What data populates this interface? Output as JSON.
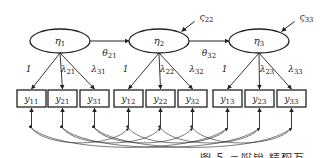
{
  "diagram": {
    "type": "structural-equation-model",
    "latents": [
      {
        "id": "eta1",
        "symbol": "η",
        "sub": "1",
        "cx": 60,
        "cy": 41,
        "rx": 30,
        "ry": 12
      },
      {
        "id": "eta2",
        "symbol": "η",
        "sub": "2",
        "cx": 159,
        "cy": 41,
        "rx": 30,
        "ry": 12
      },
      {
        "id": "eta3",
        "symbol": "η",
        "sub": "3",
        "cx": 259,
        "cy": 41,
        "rx": 30,
        "ry": 12
      }
    ],
    "paths": [
      {
        "from": "eta1",
        "to": "eta2",
        "label": "θ",
        "sub": "21"
      },
      {
        "from": "eta2",
        "to": "eta3",
        "label": "θ",
        "sub": "32"
      }
    ],
    "disturbances": [
      {
        "target": "eta2",
        "label": "ς",
        "sub": "22"
      },
      {
        "target": "eta3",
        "label": "ς",
        "sub": "33"
      }
    ],
    "indicators": [
      {
        "id": "y11",
        "symbol": "y",
        "sub": "11",
        "latent": "eta1",
        "loading": "1",
        "loading_sub": ""
      },
      {
        "id": "y21",
        "symbol": "y",
        "sub": "21",
        "latent": "eta1",
        "loading": "λ",
        "loading_sub": "21"
      },
      {
        "id": "y31",
        "symbol": "y",
        "sub": "31",
        "latent": "eta1",
        "loading": "λ",
        "loading_sub": "31"
      },
      {
        "id": "y12",
        "symbol": "y",
        "sub": "12",
        "latent": "eta2",
        "loading": "1",
        "loading_sub": ""
      },
      {
        "id": "y22",
        "symbol": "y",
        "sub": "22",
        "latent": "eta2",
        "loading": "λ",
        "loading_sub": "22"
      },
      {
        "id": "y32",
        "symbol": "y",
        "sub": "32",
        "latent": "eta2",
        "loading": "λ",
        "loading_sub": "32"
      },
      {
        "id": "y13",
        "symbol": "y",
        "sub": "13",
        "latent": "eta3",
        "loading": "1",
        "loading_sub": ""
      },
      {
        "id": "y23",
        "symbol": "y",
        "sub": "23",
        "latent": "eta3",
        "loading": "λ",
        "loading_sub": "23"
      },
      {
        "id": "y33",
        "symbol": "y",
        "sub": "33",
        "latent": "eta3",
        "loading": "λ",
        "loading_sub": "33"
      }
    ],
    "error_covariances": [
      [
        "y11",
        "y12"
      ],
      [
        "y11",
        "y13"
      ],
      [
        "y21",
        "y22"
      ],
      [
        "y21",
        "y23"
      ],
      [
        "y31",
        "y32"
      ],
      [
        "y31",
        "y33"
      ],
      [
        "y12",
        "y13"
      ],
      [
        "y22",
        "y23"
      ],
      [
        "y32",
        "y33"
      ]
    ],
    "colors": {
      "stroke": "#222222",
      "background": "#ffffff"
    }
  },
  "caption_fragment": "图 5 三阶段 结构方程模型图"
}
